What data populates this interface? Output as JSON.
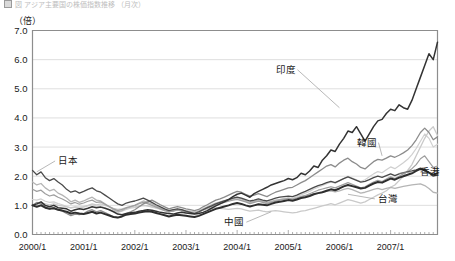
{
  "header": {
    "title_faded": "図  アジア主要国の株価指数推移  （月次）",
    "marker_icon": "square-marker-icon"
  },
  "chart_data": {
    "type": "line",
    "title": "",
    "unit_label": "（倍）",
    "xlabel": "",
    "ylabel": "",
    "ylim": [
      0.0,
      7.0
    ],
    "ytick_labels": [
      "0.0",
      "1.0",
      "2.0",
      "3.0",
      "4.0",
      "5.0",
      "6.0",
      "7.0"
    ],
    "ytick_values": [
      0,
      1,
      2,
      3,
      4,
      5,
      6,
      7
    ],
    "xtick_labels": [
      "2000/1",
      "2001/1",
      "2002/1",
      "2003/1",
      "2004/1",
      "2005/1",
      "2006/1",
      "2007/1"
    ],
    "xtick_values": [
      0,
      12,
      24,
      36,
      48,
      60,
      72,
      84
    ],
    "x_min": 0,
    "x_max": 95,
    "minor_tick_interval_months": 1,
    "grid": "horizontal",
    "legend_position": "inline-annotations",
    "series": [
      {
        "name": "印度",
        "label": "印度",
        "color": "#333333",
        "width": 1.5,
        "label_x": 57,
        "label_y": 5.55,
        "leader_to_x": 72,
        "leader_to_y": 4.35,
        "values": [
          1.0,
          1.05,
          1.12,
          1.0,
          0.95,
          1.0,
          0.92,
          0.9,
          0.88,
          0.8,
          0.85,
          0.88,
          0.86,
          0.9,
          0.95,
          0.92,
          0.94,
          0.9,
          0.85,
          0.78,
          0.7,
          0.68,
          0.72,
          0.75,
          0.76,
          0.8,
          0.82,
          0.85,
          0.83,
          0.8,
          0.76,
          0.74,
          0.72,
          0.7,
          0.74,
          0.76,
          0.74,
          0.72,
          0.7,
          0.72,
          0.76,
          0.82,
          0.9,
          0.98,
          1.05,
          1.12,
          1.2,
          1.3,
          1.38,
          1.42,
          1.35,
          1.28,
          1.4,
          1.48,
          1.55,
          1.62,
          1.7,
          1.75,
          1.8,
          1.85,
          1.92,
          1.88,
          1.95,
          2.1,
          2.05,
          2.18,
          2.35,
          2.3,
          2.55,
          2.7,
          2.9,
          2.85,
          3.1,
          3.3,
          3.55,
          3.5,
          3.7,
          3.45,
          3.2,
          3.45,
          3.7,
          3.9,
          3.95,
          4.15,
          4.3,
          4.25,
          4.45,
          4.35,
          4.3,
          4.6,
          5.0,
          5.4,
          5.8,
          6.2,
          6.0,
          6.6
        ]
      },
      {
        "name": "韓國",
        "label": "韓國",
        "color": "#8c8c8c",
        "width": 1.3,
        "label_x": 76,
        "label_y": 3.05,
        "leader_to_x": 82,
        "leader_to_y": 2.7,
        "values": [
          1.0,
          1.1,
          1.05,
          0.95,
          0.88,
          0.92,
          0.85,
          0.8,
          0.72,
          0.65,
          0.7,
          0.68,
          0.72,
          0.8,
          0.85,
          0.78,
          0.82,
          0.75,
          0.68,
          0.6,
          0.58,
          0.64,
          0.72,
          0.78,
          0.85,
          0.95,
          1.05,
          1.12,
          1.18,
          1.1,
          1.02,
          0.95,
          0.88,
          0.92,
          0.96,
          0.92,
          0.88,
          0.85,
          0.82,
          0.86,
          0.95,
          1.02,
          1.1,
          1.18,
          1.22,
          1.28,
          1.35,
          1.42,
          1.48,
          1.45,
          1.38,
          1.32,
          1.35,
          1.4,
          1.35,
          1.3,
          1.38,
          1.45,
          1.5,
          1.55,
          1.6,
          1.62,
          1.7,
          1.78,
          1.85,
          1.95,
          2.05,
          2.15,
          2.25,
          2.35,
          2.4,
          2.32,
          2.45,
          2.55,
          2.62,
          2.5,
          2.42,
          2.3,
          2.25,
          2.38,
          2.5,
          2.58,
          2.55,
          2.62,
          2.7,
          2.65,
          2.72,
          2.8,
          2.9,
          3.05,
          3.25,
          3.5,
          3.65,
          3.5,
          3.25,
          3.35
        ]
      },
      {
        "name": "香港",
        "label": "香港",
        "color": "#2e2e2e",
        "width": 2.0,
        "label_x": 90,
        "label_y": 2.05,
        "leader_to_x": 86,
        "leader_to_y": 2.1,
        "values": [
          1.0,
          0.95,
          1.0,
          0.92,
          0.88,
          0.9,
          0.85,
          0.82,
          0.78,
          0.72,
          0.75,
          0.72,
          0.7,
          0.74,
          0.78,
          0.72,
          0.75,
          0.7,
          0.65,
          0.6,
          0.58,
          0.62,
          0.68,
          0.7,
          0.72,
          0.75,
          0.78,
          0.8,
          0.78,
          0.74,
          0.7,
          0.66,
          0.62,
          0.65,
          0.68,
          0.66,
          0.64,
          0.62,
          0.6,
          0.64,
          0.7,
          0.76,
          0.82,
          0.88,
          0.92,
          0.96,
          1.0,
          1.05,
          1.08,
          1.05,
          1.0,
          0.96,
          1.0,
          1.04,
          1.02,
          1.0,
          1.05,
          1.1,
          1.12,
          1.15,
          1.18,
          1.16,
          1.2,
          1.25,
          1.28,
          1.32,
          1.38,
          1.42,
          1.45,
          1.5,
          1.55,
          1.52,
          1.58,
          1.65,
          1.7,
          1.66,
          1.62,
          1.58,
          1.6,
          1.68,
          1.75,
          1.8,
          1.78,
          1.85,
          1.92,
          1.88,
          1.95,
          2.0,
          2.05,
          2.1,
          2.18,
          2.25,
          2.2,
          2.12,
          2.05,
          2.1
        ]
      },
      {
        "name": "日本",
        "label": "日本",
        "color": "#4a4a4a",
        "width": 1.3,
        "label_x": 6,
        "label_y": 2.42,
        "leader_to_x": 1,
        "leader_to_y": 2.15,
        "values": [
          2.2,
          2.05,
          2.15,
          1.95,
          1.85,
          1.92,
          1.8,
          1.7,
          1.55,
          1.45,
          1.5,
          1.42,
          1.48,
          1.55,
          1.6,
          1.5,
          1.45,
          1.35,
          1.25,
          1.15,
          1.05,
          1.0,
          1.08,
          1.12,
          1.15,
          1.2,
          1.25,
          1.18,
          1.1,
          1.02,
          0.95,
          0.88,
          0.82,
          0.85,
          0.88,
          0.85,
          0.8,
          0.76,
          0.72,
          0.78,
          0.85,
          0.92,
          0.98,
          1.05,
          1.1,
          1.15,
          1.2,
          1.25,
          1.28,
          1.25,
          1.2,
          1.15,
          1.18,
          1.22,
          1.18,
          1.15,
          1.2,
          1.25,
          1.28,
          1.3,
          1.32,
          1.3,
          1.35,
          1.42,
          1.48,
          1.55,
          1.62,
          1.68,
          1.72,
          1.78,
          1.82,
          1.78,
          1.85,
          1.92,
          1.98,
          1.92,
          1.86,
          1.8,
          1.82,
          1.88,
          1.95,
          2.0,
          1.96,
          2.02,
          2.08,
          2.02,
          2.08,
          2.12,
          2.15,
          2.18,
          2.22,
          2.28,
          2.22,
          2.12,
          2.0,
          2.05
        ]
      },
      {
        "name": "台灣",
        "label": "台灣",
        "color": "#b5b5b5",
        "width": 1.3,
        "label_x": 81,
        "label_y": 1.12,
        "leader_to_x": 74,
        "leader_to_y": 1.38,
        "values": [
          1.8,
          1.7,
          1.75,
          1.6,
          1.5,
          1.55,
          1.42,
          1.35,
          1.25,
          1.12,
          1.18,
          1.1,
          1.15,
          1.22,
          1.28,
          1.18,
          1.15,
          1.05,
          0.95,
          0.85,
          0.78,
          0.82,
          0.9,
          0.95,
          1.0,
          1.08,
          1.15,
          1.1,
          1.05,
          0.98,
          0.9,
          0.84,
          0.78,
          0.82,
          0.86,
          0.84,
          0.8,
          0.78,
          0.75,
          0.8,
          0.88,
          0.95,
          1.02,
          1.08,
          1.12,
          1.16,
          1.2,
          1.24,
          1.26,
          1.22,
          1.16,
          1.1,
          1.14,
          1.18,
          1.14,
          1.1,
          1.14,
          1.18,
          1.2,
          1.22,
          1.24,
          1.22,
          1.26,
          1.3,
          1.32,
          1.36,
          1.4,
          1.42,
          1.45,
          1.48,
          1.5,
          1.46,
          1.5,
          1.55,
          1.58,
          1.54,
          1.48,
          1.42,
          1.45,
          1.5,
          1.55,
          1.58,
          1.54,
          1.58,
          1.62,
          1.58,
          1.62,
          1.65,
          1.68,
          1.7,
          1.72,
          1.74,
          1.68,
          1.58,
          1.45,
          1.42
        ]
      },
      {
        "name": "中國",
        "label": "中國",
        "color": "#c9c9c9",
        "width": 1.3,
        "label_x": 45,
        "label_y": 0.32,
        "leader_to_x": 56,
        "leader_to_y": 0.78,
        "values": [
          1.0,
          1.02,
          1.08,
          1.05,
          1.02,
          1.05,
          1.0,
          0.98,
          0.95,
          0.92,
          0.95,
          0.94,
          0.96,
          1.0,
          1.05,
          1.02,
          1.05,
          1.0,
          0.95,
          0.9,
          0.86,
          0.88,
          0.92,
          0.94,
          0.95,
          0.98,
          1.0,
          0.98,
          0.95,
          0.92,
          0.88,
          0.85,
          0.82,
          0.84,
          0.86,
          0.84,
          0.82,
          0.8,
          0.78,
          0.8,
          0.84,
          0.88,
          0.9,
          0.92,
          0.9,
          0.88,
          0.86,
          0.88,
          0.9,
          0.88,
          0.84,
          0.8,
          0.82,
          0.84,
          0.8,
          0.78,
          0.8,
          0.82,
          0.8,
          0.78,
          0.76,
          0.74,
          0.76,
          0.8,
          0.82,
          0.86,
          0.9,
          0.94,
          0.98,
          1.02,
          1.06,
          1.02,
          1.08,
          1.14,
          1.2,
          1.16,
          1.12,
          1.08,
          1.12,
          1.2,
          1.28,
          1.36,
          1.42,
          1.5,
          1.62,
          1.7,
          1.85,
          2.0,
          2.2,
          2.4,
          2.7,
          3.0,
          3.3,
          3.55,
          3.7,
          3.4
        ]
      },
      {
        "name": "其他A",
        "label": "",
        "color": "#9e9e9e",
        "width": 1.2,
        "label_x": null,
        "label_y": null,
        "leader_to_x": null,
        "leader_to_y": null,
        "values": [
          1.55,
          1.48,
          1.52,
          1.4,
          1.32,
          1.36,
          1.28,
          1.22,
          1.14,
          1.05,
          1.1,
          1.04,
          1.08,
          1.14,
          1.18,
          1.1,
          1.12,
          1.04,
          0.96,
          0.88,
          0.82,
          0.86,
          0.92,
          0.96,
          1.0,
          1.06,
          1.1,
          1.06,
          1.0,
          0.94,
          0.88,
          0.82,
          0.78,
          0.8,
          0.84,
          0.82,
          0.78,
          0.75,
          0.72,
          0.76,
          0.84,
          0.9,
          0.96,
          1.02,
          1.06,
          1.1,
          1.14,
          1.18,
          1.2,
          1.16,
          1.12,
          1.06,
          1.1,
          1.14,
          1.1,
          1.06,
          1.1,
          1.14,
          1.18,
          1.2,
          1.22,
          1.2,
          1.24,
          1.3,
          1.34,
          1.4,
          1.46,
          1.52,
          1.56,
          1.6,
          1.64,
          1.6,
          1.66,
          1.72,
          1.78,
          1.72,
          1.66,
          1.6,
          1.64,
          1.72,
          1.8,
          1.86,
          1.82,
          1.9,
          1.98,
          1.92,
          2.0,
          2.08,
          2.16,
          2.26,
          2.4,
          2.6,
          2.7,
          2.5,
          2.3,
          2.35
        ]
      },
      {
        "name": "其他B",
        "label": "",
        "color": "#d0d0d0",
        "width": 1.2,
        "label_x": null,
        "label_y": null,
        "leader_to_x": null,
        "leader_to_y": null,
        "values": [
          1.2,
          1.18,
          1.22,
          1.14,
          1.1,
          1.12,
          1.06,
          1.02,
          0.96,
          0.9,
          0.94,
          0.9,
          0.94,
          0.98,
          1.02,
          0.96,
          0.98,
          0.92,
          0.86,
          0.8,
          0.76,
          0.8,
          0.86,
          0.9,
          0.92,
          0.96,
          1.0,
          0.98,
          0.94,
          0.9,
          0.86,
          0.82,
          0.78,
          0.8,
          0.84,
          0.82,
          0.8,
          0.78,
          0.76,
          0.8,
          0.86,
          0.92,
          0.98,
          1.04,
          1.08,
          1.12,
          1.16,
          1.2,
          1.22,
          1.18,
          1.14,
          1.08,
          1.12,
          1.16,
          1.12,
          1.08,
          1.12,
          1.16,
          1.2,
          1.24,
          1.26,
          1.24,
          1.3,
          1.36,
          1.42,
          1.48,
          1.56,
          1.62,
          1.68,
          1.74,
          1.8,
          1.76,
          1.84,
          1.92,
          2.0,
          1.94,
          1.88,
          1.82,
          1.88,
          1.98,
          2.08,
          2.16,
          2.12,
          2.22,
          2.32,
          2.26,
          2.36,
          2.46,
          2.58,
          2.74,
          2.95,
          3.2,
          3.45,
          3.3,
          3.0,
          3.1
        ]
      }
    ]
  }
}
